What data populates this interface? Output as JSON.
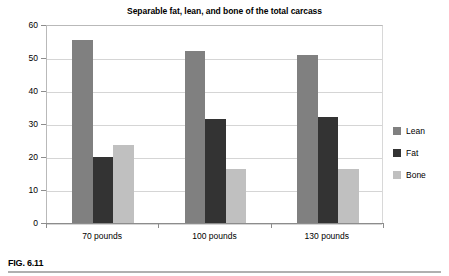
{
  "figure": {
    "caption": "FIG. 6.11"
  },
  "chart_data": {
    "type": "bar",
    "title": "Separable fat, lean, and bone of the total carcass",
    "xlabel": "",
    "ylabel": "",
    "categories": [
      "70 pounds",
      "100 pounds",
      "130 pounds"
    ],
    "series": [
      {
        "name": "Lean",
        "color": "#808080",
        "values": [
          55.5,
          52.0,
          50.8
        ]
      },
      {
        "name": "Fat",
        "color": "#333333",
        "values": [
          20.0,
          31.5,
          32.2
        ]
      },
      {
        "name": "Bone",
        "color": "#c0c0c0",
        "values": [
          23.5,
          16.5,
          16.5
        ]
      }
    ],
    "ylim": [
      0,
      60
    ],
    "yticks": [
      0,
      10,
      20,
      30,
      40,
      50,
      60
    ],
    "ytick_labels": [
      "0",
      "10",
      "20",
      "30",
      "40",
      "50",
      "60"
    ],
    "grid": true,
    "legend_position": "right"
  }
}
